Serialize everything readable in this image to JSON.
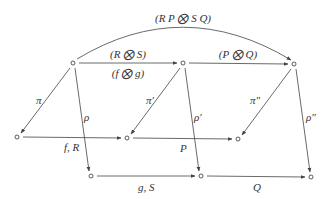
{
  "diagram": {
    "type": "commutative-diagram",
    "nodes": [
      {
        "id": "n1",
        "label": ""
      },
      {
        "id": "n2",
        "label": ""
      },
      {
        "id": "n3",
        "label": ""
      },
      {
        "id": "n4",
        "label": ""
      },
      {
        "id": "n5",
        "label": ""
      },
      {
        "id": "n6",
        "label": ""
      },
      {
        "id": "n7",
        "label": ""
      },
      {
        "id": "n8",
        "label": ""
      },
      {
        "id": "n9",
        "label": ""
      }
    ],
    "edges": [
      {
        "id": "e-top-arc",
        "from": "n1",
        "to": "n3",
        "label": "(R P ⨂ S Q)"
      },
      {
        "id": "e-n1-n2",
        "from": "n1",
        "to": "n2",
        "label_above": "(R ⨂ S)",
        "label_below": "(f ⨂ g)"
      },
      {
        "id": "e-n2-n3",
        "from": "n2",
        "to": "n3",
        "label": "(P ⨂ Q)"
      },
      {
        "id": "e-pi",
        "from": "n1",
        "to": "n4",
        "label": "π"
      },
      {
        "id": "e-rho",
        "from": "n1",
        "to": "n7",
        "label": "ρ"
      },
      {
        "id": "e-pi1",
        "from": "n2",
        "to": "n5",
        "label": "π′"
      },
      {
        "id": "e-rho1",
        "from": "n2",
        "to": "n8",
        "label": "ρ′"
      },
      {
        "id": "e-pi2",
        "from": "n3",
        "to": "n6",
        "label": "π″"
      },
      {
        "id": "e-rho2",
        "from": "n3",
        "to": "n9",
        "label": "ρ″"
      },
      {
        "id": "e-n4-n5",
        "from": "n4",
        "to": "n5",
        "label": "f, R"
      },
      {
        "id": "e-n5-n6",
        "from": "n5",
        "to": "n6",
        "label": "P"
      },
      {
        "id": "e-n7-n8",
        "from": "n7",
        "to": "n8",
        "label": "g, S"
      },
      {
        "id": "e-n8-n9",
        "from": "n8",
        "to": "n9",
        "label": "Q"
      }
    ]
  }
}
